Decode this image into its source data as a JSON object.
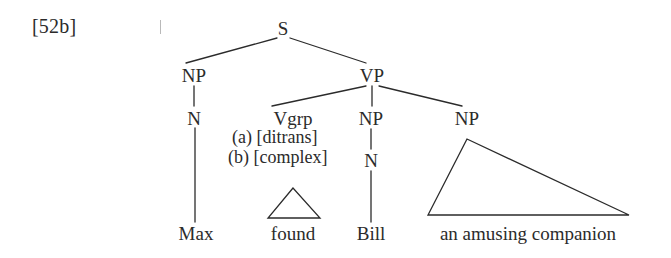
{
  "figure": {
    "example_number": "[52b]",
    "type": "syntax-tree",
    "ink_color": "#2b2b2b",
    "background_color": "#ffffff"
  },
  "tree": {
    "nodes": [
      {
        "id": "s",
        "label": "S",
        "x": 283,
        "y": 28
      },
      {
        "id": "np1",
        "label": "NP",
        "x": 194,
        "y": 75
      },
      {
        "id": "vp",
        "label": "VP",
        "x": 372,
        "y": 75
      },
      {
        "id": "n1",
        "label": "N",
        "x": 194,
        "y": 118
      },
      {
        "id": "vgrp",
        "label": "Vgrp",
        "x": 293,
        "y": 118
      },
      {
        "id": "np2",
        "label": "NP",
        "x": 371,
        "y": 118
      },
      {
        "id": "np3",
        "label": "NP",
        "x": 467,
        "y": 118
      },
      {
        "id": "n2",
        "label": "N",
        "x": 371,
        "y": 160
      }
    ],
    "features": [
      {
        "id": "feat-a",
        "label": "(a) [ditrans]",
        "x": 232,
        "y": 137
      },
      {
        "id": "feat-b",
        "label": "(b) [complex]",
        "x": 228,
        "y": 157
      }
    ],
    "terminals": [
      {
        "id": "max",
        "label": "Max",
        "x": 196,
        "y": 233
      },
      {
        "id": "found",
        "label": "found",
        "x": 293,
        "y": 233
      },
      {
        "id": "bill",
        "label": "Bill",
        "x": 371,
        "y": 233
      },
      {
        "id": "phrase",
        "label": "an amusing companion",
        "x": 528,
        "y": 233
      }
    ]
  }
}
